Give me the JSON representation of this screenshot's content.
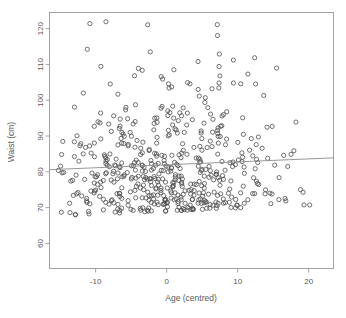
{
  "chart_data": {
    "type": "scatter",
    "title": "",
    "subtitle": "",
    "xlabel": "Age (centred)",
    "ylabel": "Waist (cm)",
    "xlim": [
      -16.5,
      23.5
    ],
    "ylim": [
      53.0,
      124.5
    ],
    "xticks": [
      -10,
      0,
      10,
      20
    ],
    "xticklabels": [
      "-10",
      "0",
      "10",
      "20"
    ],
    "yticks": [
      60,
      70,
      80,
      90,
      100,
      110,
      120
    ],
    "yticklabels": [
      "60",
      "70",
      "80",
      "90",
      "100",
      "110",
      "120"
    ],
    "grid": false,
    "legend": null,
    "legend_position": "none",
    "marker": {
      "shape": "open-circle",
      "radius_px": 2.1,
      "stroke": "#4d4d4d",
      "stroke_width": 0.8,
      "fill": "none"
    },
    "frame": {
      "box": true,
      "stroke": "#9a9a9a",
      "stroke_width": 0.9
    },
    "fit_line": {
      "label": "regression line",
      "stroke": "#8c8c8c",
      "stroke_width": 0.9,
      "x_start": -16.5,
      "y_start": 80.6,
      "x_end": 23.5,
      "y_end": 83.9,
      "slope": 0.0825,
      "intercept": 81.96
    },
    "n_points": 520,
    "x_mean": 0.0,
    "x_sd": 8.0,
    "y_mean": 82.0,
    "y_sd": 10.3,
    "points": []
  },
  "colors": {
    "background": "#ffffff",
    "axis": "#9a9a9a",
    "text": "#5a5a5a",
    "marker": "#4d4d4d",
    "fit_line": "#8c8c8c"
  }
}
